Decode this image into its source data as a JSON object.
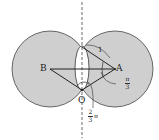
{
  "diagram": {
    "type": "geometry",
    "points": {
      "A": "A",
      "B": "B",
      "O": "O"
    },
    "labels": {
      "radius": "1",
      "angle_pi3_num": "π",
      "angle_pi3_den": "3",
      "angle_2pi3_num": "2",
      "angle_2pi3_den": "3",
      "angle_2pi3_pi": "π"
    },
    "colors": {
      "circle_fill": "#cfcfcf",
      "lens_fill": "#ffffff",
      "stroke": "#333333"
    }
  }
}
